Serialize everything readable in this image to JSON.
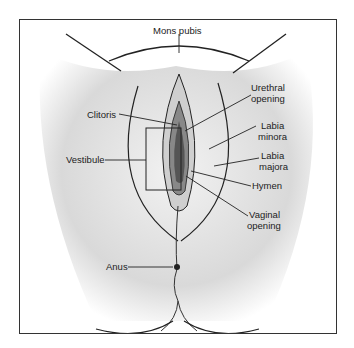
{
  "diagram": {
    "type": "anatomical illustration",
    "labels": {
      "mons_pubis": "Mons pubis",
      "clitoris": "Clitoris",
      "urethral_opening_1": "Urethral",
      "urethral_opening_2": "opening",
      "labia_minora_1": "Labia",
      "labia_minora_2": "minora",
      "labia_majora_1": "Labia",
      "labia_majora_2": "majora",
      "vestibule": "Vestibule",
      "hymen": "Hymen",
      "vaginal_opening_1": "Vaginal",
      "vaginal_opening_2": "opening",
      "anus": "Anus"
    }
  }
}
